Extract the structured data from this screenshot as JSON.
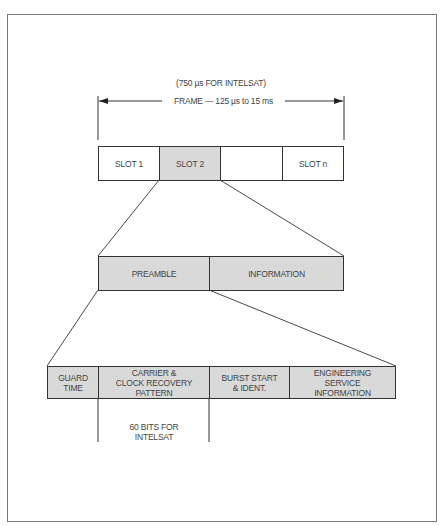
{
  "diagram": {
    "frame_note": "(750 µs FOR INTELSAT)",
    "frame_label": "FRAME — 125 µs to 15 ms",
    "slots": [
      {
        "label": "SLOT 1",
        "shaded": false
      },
      {
        "label": "SLOT 2",
        "shaded": true
      },
      {
        "label": "",
        "shaded": false
      },
      {
        "label": "SLOT n",
        "shaded": false
      }
    ],
    "burst": [
      {
        "label": "PREAMBLE"
      },
      {
        "label": "INFORMATION"
      }
    ],
    "preamble_fields": [
      {
        "label": "GUARD\nTIME"
      },
      {
        "label": "CARRIER &\nCLOCK RECOVERY\nPATTERN"
      },
      {
        "label": "BURST START\n& IDENT."
      },
      {
        "label": "ENGINEERING\nSERVICE\nINFORMATION"
      }
    ],
    "bits_note": "60 BITS FOR\nINTELSAT",
    "colors": {
      "shaded_fill": "#d9d9d9",
      "line": "#333333"
    }
  }
}
